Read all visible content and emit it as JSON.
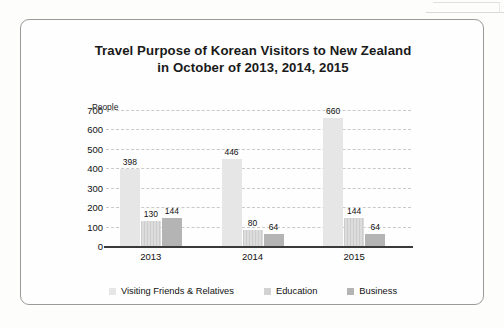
{
  "frame": {
    "artifact_name": "scan-edge-artifact"
  },
  "chart_data": {
    "type": "bar",
    "title": "Travel Purpose of Korean Visitors to New Zealand",
    "subtitle": "in October of 2013, 2014, 2015",
    "title_full": "Travel Purpose of Korean Visitors to New Zealand in October of 2013, 2014, 2015",
    "xlabel": "",
    "ylabel": "People",
    "categories": [
      "2013",
      "2014",
      "2015"
    ],
    "series": [
      {
        "name": "Visiting Friends & Relatives",
        "color": "#e6e6e6",
        "values": [
          398,
          446,
          660
        ]
      },
      {
        "name": "Education",
        "color": "#d2d2d2",
        "values": [
          130,
          80,
          144
        ]
      },
      {
        "name": "Business",
        "color": "#b4b4b4",
        "values": [
          144,
          64,
          64
        ]
      }
    ],
    "yticks": [
      0,
      100,
      200,
      300,
      400,
      500,
      600,
      700
    ],
    "ytick_labels": [
      "0",
      "100",
      "200",
      "300",
      "400",
      "500",
      "600",
      "700"
    ],
    "ylim": [
      0,
      700
    ],
    "grid": "horizontal-dashed",
    "legend_position": "bottom-center",
    "data_labels": true
  }
}
